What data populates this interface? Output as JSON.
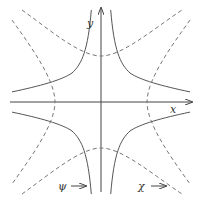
{
  "diagram": {
    "axes": {
      "x_label": "x",
      "y_label": "y"
    },
    "labels": {
      "psi": "ψ",
      "chi": "χ"
    },
    "colors": {
      "solid": "#555555",
      "dashed": "#777777",
      "axis": "#444444"
    }
  }
}
